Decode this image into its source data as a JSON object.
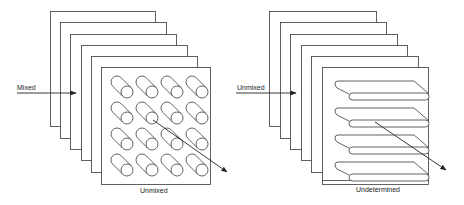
{
  "colors": {
    "stroke": "#3a3a3a",
    "fill": "#ffffff",
    "text": "#222222"
  },
  "diagrams": [
    {
      "id": "mixed-to-unmixed",
      "input_label": "Mixed",
      "output_label": "Unmixed",
      "element_type": "cylinders",
      "panels": [
        {
          "x": 50,
          "y": 11,
          "w": 105,
          "h": 115
        },
        {
          "x": 60,
          "y": 22,
          "w": 106,
          "h": 116
        },
        {
          "x": 70,
          "y": 34,
          "w": 106,
          "h": 115
        },
        {
          "x": 81,
          "y": 45,
          "w": 106,
          "h": 115
        },
        {
          "x": 91,
          "y": 56,
          "w": 106,
          "h": 116
        },
        {
          "x": 101,
          "y": 67,
          "w": 109,
          "h": 117
        }
      ],
      "input_arrow": {
        "x1": 17,
        "y1": 93,
        "x2": 76,
        "y2": 93
      },
      "input_label_pos": {
        "x": 17,
        "y": 84
      },
      "output_arrow": {
        "x1": 153,
        "y1": 120,
        "x2": 227,
        "y2": 172
      },
      "output_label_pos": {
        "x": 140,
        "y": 187
      },
      "grid": {
        "cols": 4,
        "rows": 4,
        "x0": 117,
        "y0": 82,
        "dx": 25,
        "dy": 26,
        "offset": 10,
        "r": 6
      }
    },
    {
      "id": "unmixed-to-undetermined",
      "input_label": "Unmixed",
      "output_label": "Undetermined",
      "element_type": "plates",
      "panels": [
        {
          "x": 269,
          "y": 11,
          "w": 107,
          "h": 115
        },
        {
          "x": 280,
          "y": 22,
          "w": 106,
          "h": 116
        },
        {
          "x": 290,
          "y": 34,
          "w": 107,
          "h": 115
        },
        {
          "x": 301,
          "y": 45,
          "w": 106,
          "h": 115
        },
        {
          "x": 311,
          "y": 56,
          "w": 107,
          "h": 116
        },
        {
          "x": 322,
          "y": 67,
          "w": 106,
          "h": 113
        }
      ],
      "baseline": {
        "x1": 322,
        "y1": 184,
        "x2": 428,
        "y2": 184
      },
      "input_arrow": {
        "x1": 236,
        "y1": 93,
        "x2": 296,
        "y2": 93
      },
      "input_label_pos": {
        "x": 237,
        "y": 84
      },
      "output_arrow": {
        "x1": 375,
        "y1": 122,
        "x2": 446,
        "y2": 170
      },
      "output_label_pos": {
        "x": 356,
        "y": 186
      },
      "plates": {
        "count": 4,
        "x0": 335,
        "y0": 81,
        "dy": 27,
        "len": 79,
        "depth_x": 14,
        "depth_y": 12,
        "thick": 7
      }
    }
  ]
}
